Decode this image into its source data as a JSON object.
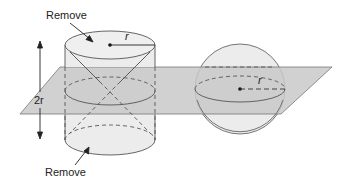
{
  "diagram": {
    "labels": {
      "remove_top": "Remove",
      "remove_bottom": "Remove",
      "height": "2r",
      "cylinder_radius": "r",
      "sphere_radius": "r"
    },
    "colors": {
      "plane_fill": "#c9c9c9",
      "solid_fill": "#ececec",
      "stroke": "#555555",
      "text": "#222222"
    },
    "shapes": {
      "cylinder": "cylinder with two cones removed (top and bottom)",
      "plane": "horizontal cutting plane",
      "sphere": "sphere of radius r"
    }
  }
}
